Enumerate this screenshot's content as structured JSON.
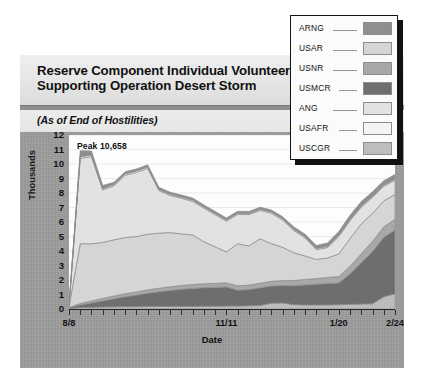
{
  "title": {
    "line1": "Reserve Component Individual Volunteers",
    "line2": "Supporting Operation Desert Storm",
    "subtitle": "(As of End of Hostilities)"
  },
  "annotation": {
    "peak": "Peak  10,658"
  },
  "legend": {
    "items": [
      {
        "label": "ARNG",
        "color": "#8f8f8f"
      },
      {
        "label": "USAR",
        "color": "#d5d5d5"
      },
      {
        "label": "USNR",
        "color": "#a8a8a8"
      },
      {
        "label": "USMCR",
        "color": "#6e6e6e"
      },
      {
        "label": "ANG",
        "color": "#e2e2e2"
      },
      {
        "label": "USAFR",
        "color": "#f4f4f4"
      },
      {
        "label": "USCGR",
        "color": "#bdbdbd"
      }
    ]
  },
  "chart_data": {
    "type": "area",
    "stacked": true,
    "title": "Reserve Component Individual Volunteers Supporting Operation Desert Storm",
    "subtitle": "(As of End of Hostilities)",
    "xlabel": "Date",
    "ylabel": "Thousands",
    "ylim": [
      0,
      12
    ],
    "yticks": [
      0,
      1,
      2,
      3,
      4,
      5,
      6,
      7,
      8,
      9,
      10,
      11,
      12
    ],
    "ytick_labels": [
      "0",
      "1",
      "2",
      "3",
      "4",
      "5",
      "6",
      "7",
      "8",
      "9",
      "10",
      "11",
      "12"
    ],
    "grid": true,
    "legend_position": "top-right",
    "annotations": [
      {
        "text": "Peak  10,658",
        "x_index": 3,
        "value": 10.658
      }
    ],
    "x_tick_labels": [
      {
        "index": 0,
        "label": "8/8"
      },
      {
        "index": 14,
        "label": "11/11"
      },
      {
        "index": 24,
        "label": "1/20"
      },
      {
        "index": 29,
        "label": "2/24"
      }
    ],
    "x": [
      "8/8",
      "8/15",
      "8/22",
      "8/29",
      "9/5",
      "9/12",
      "9/19",
      "9/26",
      "10/3",
      "10/10",
      "10/17",
      "10/24",
      "10/31",
      "11/4",
      "11/11",
      "11/18",
      "11/25",
      "12/2",
      "12/9",
      "12/16",
      "12/23",
      "12/30",
      "1/6",
      "1/13",
      "1/20",
      "1/27",
      "2/3",
      "2/10",
      "2/17",
      "2/24"
    ],
    "series": [
      {
        "name": "USCGR",
        "values": [
          0.05,
          0.1,
          0.12,
          0.14,
          0.15,
          0.16,
          0.16,
          0.17,
          0.17,
          0.18,
          0.18,
          0.18,
          0.19,
          0.19,
          0.2,
          0.2,
          0.22,
          0.24,
          0.4,
          0.42,
          0.3,
          0.28,
          0.28,
          0.28,
          0.3,
          0.32,
          0.34,
          0.36,
          0.85,
          1.05
        ]
      },
      {
        "name": "USMCR",
        "values": [
          0.03,
          0.18,
          0.3,
          0.42,
          0.55,
          0.68,
          0.8,
          0.92,
          1.02,
          1.1,
          1.18,
          1.24,
          1.28,
          1.3,
          1.32,
          1.1,
          1.12,
          1.22,
          1.18,
          1.2,
          1.3,
          1.38,
          1.42,
          1.48,
          1.5,
          2.1,
          2.85,
          3.6,
          4.1,
          4.4
        ]
      },
      {
        "name": "USNR",
        "values": [
          0.02,
          0.1,
          0.14,
          0.17,
          0.19,
          0.21,
          0.22,
          0.23,
          0.24,
          0.25,
          0.26,
          0.27,
          0.27,
          0.28,
          0.28,
          0.3,
          0.31,
          0.32,
          0.33,
          0.34,
          0.36,
          0.38,
          0.4,
          0.42,
          0.44,
          0.52,
          0.62,
          0.7,
          0.72,
          0.74
        ]
      },
      {
        "name": "USAR",
        "values": [
          0.07,
          4.12,
          3.94,
          3.86,
          3.88,
          3.88,
          3.82,
          3.84,
          3.8,
          3.74,
          3.56,
          3.42,
          2.9,
          2.52,
          2.14,
          2.9,
          2.7,
          3.06,
          2.6,
          2.3,
          1.92,
          1.62,
          1.32,
          1.34,
          1.56,
          1.92,
          2.06,
          1.94,
          1.78,
          1.7
        ]
      },
      {
        "name": "ANG",
        "values": [
          0.04,
          5.9,
          6.0,
          3.62,
          3.72,
          4.3,
          4.42,
          4.54,
          2.94,
          2.56,
          2.46,
          2.32,
          2.32,
          2.22,
          2.12,
          2.02,
          2.16,
          1.96,
          2.1,
          1.88,
          1.54,
          1.24,
          0.68,
          0.72,
          1.2,
          1.24,
          1.16,
          1.1,
          1.02,
          1.0
        ]
      },
      {
        "name": "USAFR",
        "values": [
          0.02,
          0.12,
          0.1,
          0.09,
          0.09,
          0.1,
          0.1,
          0.1,
          0.08,
          0.08,
          0.08,
          0.08,
          0.08,
          0.08,
          0.08,
          0.08,
          0.08,
          0.08,
          0.08,
          0.08,
          0.08,
          0.08,
          0.08,
          0.08,
          0.08,
          0.08,
          0.08,
          0.08,
          0.08,
          0.08
        ]
      },
      {
        "name": "ARNG",
        "values": [
          0.02,
          0.4,
          0.3,
          0.22,
          0.16,
          0.14,
          0.14,
          0.14,
          0.14,
          0.14,
          0.14,
          0.14,
          0.14,
          0.14,
          0.14,
          0.14,
          0.14,
          0.14,
          0.14,
          0.14,
          0.16,
          0.18,
          0.2,
          0.24,
          0.26,
          0.28,
          0.3,
          0.3,
          0.3,
          0.3
        ]
      }
    ]
  }
}
